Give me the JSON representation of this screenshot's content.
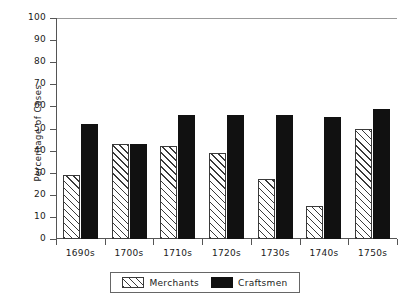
{
  "chart_data": {
    "type": "bar",
    "title": "",
    "subtitle": "",
    "xlabel": "",
    "ylabel": "Percentage of Cases",
    "ylim": [
      0,
      100
    ],
    "ytick_step": 10,
    "yticks": [
      0,
      10,
      20,
      30,
      40,
      50,
      60,
      70,
      80,
      90,
      100
    ],
    "grid": false,
    "legend_position": "bottom-center",
    "categories": [
      "1690s",
      "1700s",
      "1710s",
      "1720s",
      "1730s",
      "1740s",
      "1750s"
    ],
    "series": [
      {
        "name": "Merchants",
        "fill": "diagonal-hatch",
        "color": "#3a3a3a",
        "values": [
          29,
          43,
          42,
          39,
          27,
          15,
          50
        ]
      },
      {
        "name": "Craftsmen",
        "fill": "solid",
        "color": "#111111",
        "values": [
          52,
          43,
          56,
          56,
          56,
          55,
          59
        ]
      }
    ]
  },
  "legend": {
    "entries": [
      {
        "label": "Merchants",
        "swatch": "hatched-swatch"
      },
      {
        "label": "Craftsmen",
        "swatch": "solid-black-swatch"
      }
    ]
  }
}
